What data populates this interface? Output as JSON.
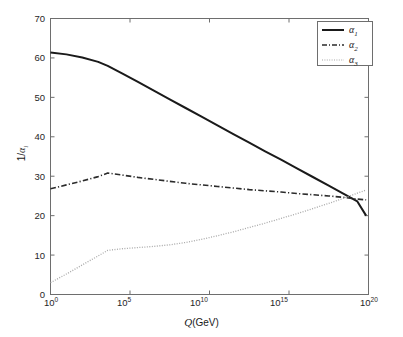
{
  "figure": {
    "background": "#ffffff",
    "axes_color": "#6e6e6e",
    "text_color": "#1a1a1a"
  },
  "axis": {
    "x_label_prefix": "Q",
    "x_label_suffix": "(GeV)",
    "y_label_numerator": "1/",
    "y_label_symbol": "α",
    "y_label_subscript": "i",
    "x_ticks": [
      {
        "mantissa": "10",
        "exponent": "0",
        "value": 0
      },
      {
        "mantissa": "10",
        "exponent": "5",
        "value": 5
      },
      {
        "mantissa": "10",
        "exponent": "10",
        "value": 10
      },
      {
        "mantissa": "10",
        "exponent": "15",
        "value": 15
      },
      {
        "mantissa": "10",
        "exponent": "20",
        "value": 20
      }
    ],
    "y_ticks": [
      "0",
      "10",
      "20",
      "30",
      "40",
      "50",
      "60",
      "70"
    ]
  },
  "legend": {
    "position": "top-right",
    "border_color": "#6e6e6e",
    "entries": [
      {
        "symbol": "α",
        "subscript": "1",
        "style": "solid",
        "color": "#1a1a1a",
        "name": "alpha-1"
      },
      {
        "symbol": "α",
        "subscript": "2",
        "style": "dashdot",
        "color": "#2b2b2b",
        "name": "alpha-2"
      },
      {
        "symbol": "α",
        "subscript": "3",
        "style": "dotted",
        "color": "#a8a8a8",
        "name": "alpha-3"
      }
    ]
  },
  "chart_data": {
    "type": "line",
    "title": "",
    "xlabel": "Q(GeV)",
    "ylabel": "1/α_i",
    "xscale": "log10",
    "xlim": [
      0,
      20
    ],
    "ylim": [
      0,
      70
    ],
    "xtick_values": [
      0,
      5,
      10,
      15,
      20
    ],
    "ytick_values": [
      0,
      10,
      20,
      30,
      40,
      50,
      60,
      70
    ],
    "grid": false,
    "legend_position": "upper right",
    "series": [
      {
        "name": "α₁",
        "style": "solid",
        "color": "#1a1a1a",
        "x": [
          0,
          1,
          2,
          3,
          3.6,
          4.5,
          5.5,
          6.5,
          7.5,
          8.5,
          9.5,
          10.5,
          11.5,
          12.5,
          13.5,
          14.5,
          15.5,
          16.5,
          17.5,
          18.5,
          19.3
        ],
        "y": [
          61.4,
          60.9,
          60.1,
          59.0,
          58.0,
          56.1,
          53.9,
          51.7,
          49.5,
          47.3,
          45.1,
          42.9,
          40.7,
          38.5,
          36.3,
          34.2,
          32.0,
          29.8,
          27.6,
          25.4,
          23.6
        ],
        "y_end": 20.0
      },
      {
        "name": "α₂",
        "style": "dashdot",
        "color": "#2b2b2b",
        "x": [
          0,
          1,
          2,
          3,
          3.6,
          4.5,
          5.5,
          6.5,
          7.5,
          8.5,
          9.5,
          10.5,
          11.5,
          12.5,
          13.5,
          14.5,
          15.5,
          16.5,
          17.5,
          18.5,
          19.3
        ],
        "y": [
          26.8,
          27.8,
          28.8,
          29.9,
          30.8,
          30.3,
          29.7,
          29.2,
          28.7,
          28.2,
          27.8,
          27.4,
          27.0,
          26.6,
          26.3,
          26.0,
          25.6,
          25.3,
          25.0,
          24.6,
          24.2
        ],
        "y_end": 24.0
      },
      {
        "name": "α₃",
        "style": "dotted",
        "color": "#a8a8a8",
        "x": [
          0,
          1,
          2,
          3,
          3.6,
          4.5,
          5.5,
          6.5,
          7.5,
          8.5,
          9.5,
          10.5,
          11.5,
          12.5,
          13.5,
          14.5,
          15.5,
          16.5,
          17.5,
          18.5,
          19.3
        ],
        "y": [
          3.0,
          5.2,
          7.5,
          9.8,
          11.2,
          11.6,
          11.9,
          12.2,
          12.6,
          13.2,
          14.0,
          14.9,
          15.9,
          17.0,
          18.1,
          19.3,
          20.5,
          21.8,
          23.1,
          24.5,
          25.7
        ],
        "y_end": 26.5
      }
    ]
  }
}
